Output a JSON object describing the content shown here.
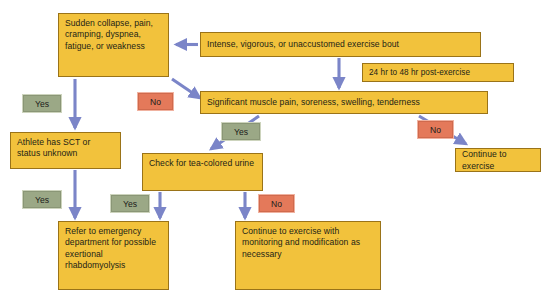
{
  "diagram": {
    "colors": {
      "node_fill": "#f2c23c",
      "node_border": "#9a7318",
      "arrow": "#7b85c8",
      "yes_badge": "#9ba886",
      "no_badge": "#e4795a",
      "background": "#ffffff",
      "text": "#231f16"
    },
    "nodes": [
      {
        "id": "sudden_collapse",
        "text": "Sudden collapse, pain, cramping, dyspnea, fatigue, or weakness"
      },
      {
        "id": "exercise_bout",
        "text": "Intense, vigorous, or unaccustomed exercise bout"
      },
      {
        "id": "post_exercise_window",
        "text": "24 hr to 48 hr post-exercise"
      },
      {
        "id": "significant_muscle_pain",
        "text": "Significant muscle pain, soreness, swelling, tenderness"
      },
      {
        "id": "athlete_sct",
        "text": "Athlete has SCT or status unknown"
      },
      {
        "id": "check_urine",
        "text": "Check for tea-colored urine"
      },
      {
        "id": "continue_exercise",
        "text": "Continue to exercise"
      },
      {
        "id": "refer_emergency",
        "text": "Refer to emergency department for possible exertional rhabdomyolysis"
      },
      {
        "id": "continue_monitoring",
        "text": "Continue to exercise with monitoring and modification as necessary"
      }
    ],
    "badges": [
      {
        "id": "yes_sct",
        "label": "Yes",
        "kind": "yes"
      },
      {
        "id": "no_muscle_pain_left",
        "label": "No",
        "kind": "no"
      },
      {
        "id": "yes_muscle_pain",
        "label": "Yes",
        "kind": "yes"
      },
      {
        "id": "no_muscle_pain_right",
        "label": "No",
        "kind": "no"
      },
      {
        "id": "yes_refer_left",
        "label": "Yes",
        "kind": "yes"
      },
      {
        "id": "yes_urine",
        "label": "Yes",
        "kind": "yes"
      },
      {
        "id": "no_urine",
        "label": "No",
        "kind": "no"
      }
    ]
  }
}
